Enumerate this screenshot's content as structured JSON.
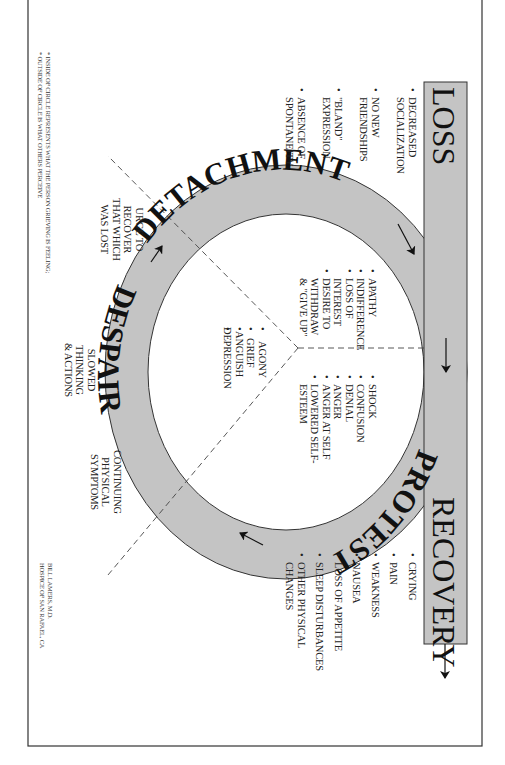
{
  "diagram": {
    "orientation": "rotated 90 degrees clockwise",
    "colors": {
      "band_fill": "#c4c4c4",
      "outline": "#333333",
      "text": "#1a1a1a",
      "dashed": "#444444",
      "background": "#ffffff"
    },
    "bar": {
      "start_label": "LOSS",
      "end_label": "RECOVERY"
    },
    "ring": {
      "stage_labels": {
        "detachment": "DETACHMENT",
        "protest": "PROTEST",
        "despair": "DESPAIR"
      }
    },
    "loss_symptoms": {
      "items": [
        [
          "DECREASED",
          "SOCIALIZATION"
        ],
        [
          "NO NEW",
          "FRIENDSHIPS"
        ],
        [
          "\"BLAND\"",
          "EXPRESSION"
        ],
        [
          "ABSENCE OF",
          "SPONTANEITY"
        ]
      ]
    },
    "recovery_symptoms": {
      "items": [
        [
          "CRYING"
        ],
        [
          "PAIN"
        ],
        [
          "WEAKNESS"
        ],
        [
          "NAUSEA"
        ],
        [
          "LOSS OF APPETITE"
        ],
        [
          "SLEEP DISTURBANCES"
        ],
        [
          "OTHER PHYSICAL",
          "CHANGES"
        ]
      ]
    },
    "inside_detachment": {
      "items": [
        [
          "APATHY"
        ],
        [
          "INDIFFERENCE"
        ],
        [
          "LOSS OF",
          "INTEREST"
        ],
        [
          "DESIRE TO",
          "WITHDRAW",
          "& \"GIVE UP\""
        ]
      ]
    },
    "inside_protest": {
      "items": [
        [
          "SHOCK"
        ],
        [
          "CONFUSION"
        ],
        [
          "DENIAL"
        ],
        [
          "ANGER"
        ],
        [
          "ANGER AT SELF"
        ],
        [
          "LOWERED SELF-",
          "ESTEEM"
        ]
      ]
    },
    "inside_despair": {
      "items": [
        [
          "AGONY"
        ],
        [
          "GRIEF"
        ],
        [
          "ANGUISH"
        ],
        [
          "DEPRESSION"
        ]
      ]
    },
    "outside_labels": {
      "urge": [
        "URGE TO",
        "RECOVER",
        "THAT WHICH",
        "WAS LOST"
      ],
      "slowed": [
        "SLOWED",
        "THINKING",
        "& ACTIONS"
      ],
      "continuing": [
        "CONTINUING",
        "PHYSICAL",
        "SYMPTOMS"
      ]
    },
    "footnotes": [
      "* INSIDE OF CIRCLE REPRESENTS WHAT THE PERSON GRIEVING IS FEELING;",
      "* OUTSIDE OF CIRCLE IS WHAT OTHERS PERCEIVE"
    ],
    "credit": [
      "BILL LAMERS, M.D.",
      "HOSPICE OF SAN RAFAEL, CA"
    ]
  }
}
